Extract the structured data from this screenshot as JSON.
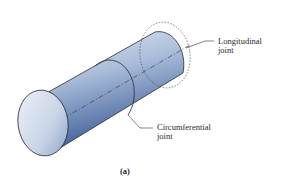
{
  "figure": {
    "colors": {
      "body_light": "#d8e2ef",
      "body_mid": "#9fb3d4",
      "body_dark": "#3f5f9a",
      "outline": "#2b2b33",
      "background": "#ffffff"
    }
  },
  "labels": {
    "longitudinal": [
      "Longitudinal",
      "joint"
    ],
    "circumferential": [
      "Circumferential",
      "joint"
    ]
  },
  "caption": "(a)"
}
